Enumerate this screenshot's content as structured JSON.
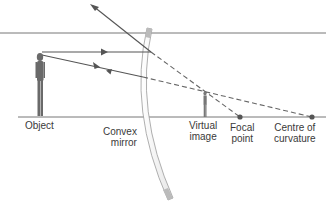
{
  "diagram": {
    "colors": {
      "line": "#555555",
      "mirror_edge": "#9a9a9a",
      "mirror_fill": "#f2f2f2",
      "dot": "#555555",
      "text": "#3a3a3a"
    },
    "labels": {
      "object": "Object",
      "mirror": [
        "Convex",
        "mirror"
      ],
      "virtual_image": [
        "Virtual",
        "image"
      ],
      "focal_point": [
        "Focal",
        "point"
      ],
      "centre_of_curvature": [
        "Centre of",
        "curvature"
      ]
    },
    "elements": {
      "object": {
        "x": 40,
        "top": 52,
        "bottom": 117
      },
      "virtual_image": {
        "x": 205,
        "top": 91,
        "bottom": 117
      },
      "focal_point": {
        "x": 240,
        "y": 117
      },
      "centre_of_curvature": {
        "x": 312,
        "y": 117
      },
      "principal_axis_y": 117,
      "top_line_y": 33
    },
    "rays": [
      {
        "name": "parallel-ray",
        "incident": "object top → mirror, parallel to axis",
        "reflected": "diverges upward, appears to come from focal point"
      },
      {
        "name": "centre-ray",
        "incident": "object top → toward centre of curvature",
        "reflected": "returns along same path"
      }
    ]
  }
}
